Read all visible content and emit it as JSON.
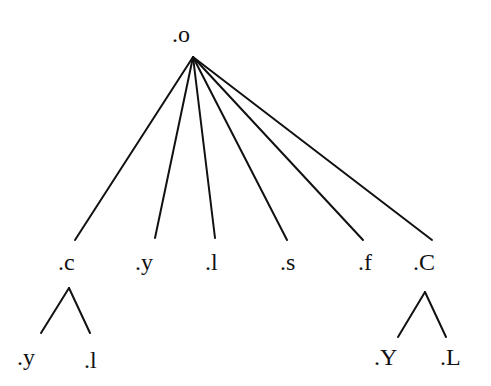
{
  "diagram": {
    "type": "tree",
    "colors": {
      "line": "#111111",
      "text": "#111111",
      "background": "#ffffff"
    },
    "root": {
      "label": ".o",
      "x": 172,
      "y": 22,
      "apex": [
        193,
        57
      ]
    },
    "children": [
      {
        "label": ".c",
        "x": 58,
        "y": 250,
        "edge_end": [
          75,
          240
        ]
      },
      {
        "label": ".y",
        "x": 135,
        "y": 250,
        "edge_end": [
          155,
          238
        ]
      },
      {
        "label": ".l",
        "x": 205,
        "y": 250,
        "edge_end": [
          215,
          238
        ]
      },
      {
        "label": ".s",
        "x": 280,
        "y": 250,
        "edge_end": [
          287,
          240
        ]
      },
      {
        "label": ".f",
        "x": 358,
        "y": 250,
        "edge_end": [
          363,
          240
        ]
      },
      {
        "label": ".C",
        "x": 413,
        "y": 250,
        "edge_end": [
          432,
          240
        ]
      }
    ],
    "subtrees": [
      {
        "parent": ".c",
        "apex": [
          69,
          288
        ],
        "children": [
          {
            "label": ".y",
            "x": 17,
            "y": 345,
            "edge_end": [
              41,
              333
            ]
          },
          {
            "label": ".l",
            "x": 84,
            "y": 348,
            "edge_end": [
              90,
              333
            ]
          }
        ]
      },
      {
        "parent": ".C",
        "apex": [
          425,
          292
        ],
        "children": [
          {
            "label": ".Y",
            "x": 374,
            "y": 345,
            "edge_end": [
              398,
              337
            ]
          },
          {
            "label": ".L",
            "x": 440,
            "y": 345,
            "edge_end": [
              446,
              337
            ]
          }
        ]
      }
    ]
  }
}
